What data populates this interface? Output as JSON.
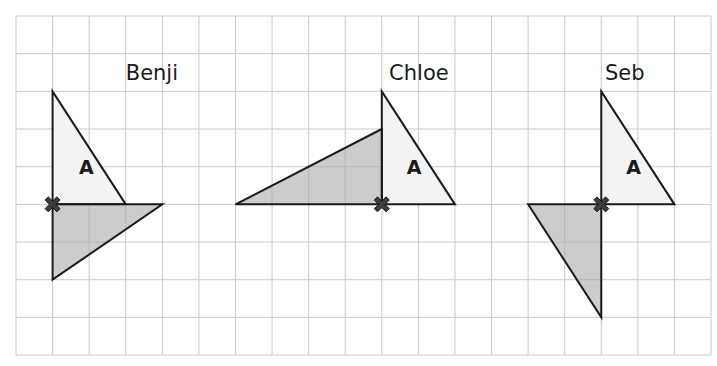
{
  "colors": {
    "grid": "#c9c9c9",
    "outline": "#1a1a1a",
    "shape_a_fill": "#f3f3f3",
    "rotated_fill": "#c4c4c4",
    "pivot": "#3d3d3d"
  },
  "grid": {
    "left": 16,
    "top": 16,
    "cols": 19,
    "rows": 9,
    "cell_w": 36.58,
    "cell_h": 37.67
  },
  "panels": [
    {
      "name": "Benji",
      "label_pos": [
        3,
        1.7
      ],
      "pivot": [
        1,
        5
      ],
      "shape_a": [
        [
          1,
          2
        ],
        [
          1,
          5
        ],
        [
          3,
          5
        ]
      ],
      "shape_a_label": "A",
      "shape_a_label_pos": [
        1.72,
        4.2
      ],
      "rotated": [
        [
          1,
          5
        ],
        [
          4,
          5
        ],
        [
          1,
          7
        ]
      ]
    },
    {
      "name": "Chloe",
      "label_pos": [
        10.2,
        1.7
      ],
      "pivot": [
        10,
        5
      ],
      "shape_a": [
        [
          10,
          2
        ],
        [
          10,
          5
        ],
        [
          12,
          5
        ]
      ],
      "shape_a_label": "A",
      "shape_a_label_pos": [
        10.68,
        4.2
      ],
      "rotated": [
        [
          10,
          3
        ],
        [
          10,
          5
        ],
        [
          6,
          5
        ]
      ]
    },
    {
      "name": "Seb",
      "label_pos": [
        16.1,
        1.7
      ],
      "pivot": [
        16,
        5
      ],
      "shape_a": [
        [
          16,
          2
        ],
        [
          16,
          5
        ],
        [
          18,
          5
        ]
      ],
      "shape_a_label": "A",
      "shape_a_label_pos": [
        16.68,
        4.2
      ],
      "rotated": [
        [
          14,
          5
        ],
        [
          16,
          5
        ],
        [
          16,
          8
        ]
      ]
    }
  ]
}
